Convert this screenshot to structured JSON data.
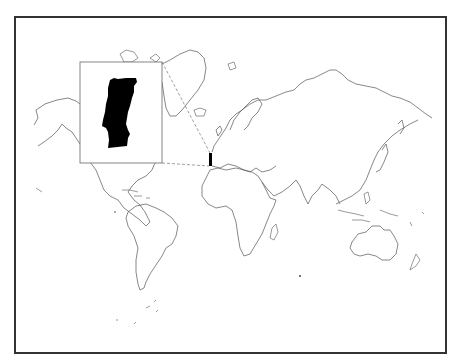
{
  "map": {
    "type": "world outline locator map",
    "projection": "Mercator-like",
    "highlighted_country": "Portugal",
    "highlight_color": "#000000",
    "outline_color": "#555555",
    "frame_color": "#333333",
    "background_color": "#ffffff",
    "inset": {
      "shows": "Portugal",
      "box": {
        "x": 80,
        "y": 62,
        "width": 82,
        "height": 101
      },
      "connector_style": "dashed",
      "target_marker": {
        "x": 209,
        "y": 153,
        "width": 3,
        "height": 13
      }
    },
    "continents": [
      "North America",
      "Greenland",
      "South America",
      "Europe",
      "Africa",
      "Asia",
      "Australia",
      "New Zealand",
      "Antarctic islands"
    ]
  }
}
